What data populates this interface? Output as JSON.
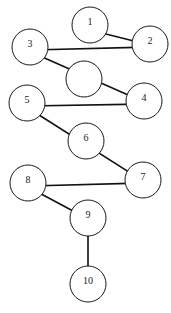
{
  "diagram": {
    "type": "directed-graph",
    "canvas": {
      "width": 171,
      "height": 313
    },
    "colors": {
      "background": "#ffffff",
      "node_stroke": "#1a1a1a",
      "node_fill": "#ffffff",
      "edge_stroke": "#111111",
      "label_color": "#1a1a1a"
    },
    "node_radius": 18,
    "nodes": [
      {
        "id": "n1",
        "label": "1",
        "cx": 90,
        "cy": 25,
        "r": 18,
        "labeled": true
      },
      {
        "id": "n2",
        "label": "2",
        "cx": 150,
        "cy": 44,
        "r": 18,
        "labeled": true
      },
      {
        "id": "n3",
        "label": "3",
        "cx": 30,
        "cy": 47,
        "r": 18,
        "labeled": true
      },
      {
        "id": "nU",
        "label": "",
        "cx": 84,
        "cy": 79,
        "r": 18,
        "labeled": false
      },
      {
        "id": "n4",
        "label": "4",
        "cx": 144,
        "cy": 101,
        "r": 18,
        "labeled": true
      },
      {
        "id": "n5",
        "label": "5",
        "cx": 27,
        "cy": 103,
        "r": 18,
        "labeled": true
      },
      {
        "id": "n6",
        "label": "6",
        "cx": 86,
        "cy": 141,
        "r": 18,
        "labeled": true
      },
      {
        "id": "n7",
        "label": "7",
        "cx": 143,
        "cy": 180,
        "r": 18,
        "labeled": true
      },
      {
        "id": "n8",
        "label": "8",
        "cx": 28,
        "cy": 183,
        "r": 18,
        "labeled": true
      },
      {
        "id": "n9",
        "label": "9",
        "cx": 88,
        "cy": 218,
        "r": 18,
        "labeled": true
      },
      {
        "id": "n10",
        "label": "10",
        "cx": 88,
        "cy": 284,
        "r": 18,
        "labeled": true
      }
    ],
    "edges": [
      {
        "id": "e1",
        "from": "n1",
        "to": "n2",
        "from_label": "1",
        "to_label": "2",
        "x1": 86,
        "y1": 29,
        "x2": 150,
        "y2": 45,
        "arrow": true
      },
      {
        "id": "e2",
        "from": "n3",
        "to": "n2",
        "from_label": "3",
        "to_label": "2",
        "x1": 32,
        "y1": 50,
        "x2": 150,
        "y2": 47,
        "arrow": true
      },
      {
        "id": "e3",
        "from": "n3",
        "to": "n4",
        "from_label": "3",
        "to_label": "4",
        "x1": 31,
        "y1": 52,
        "x2": 144,
        "y2": 102,
        "arrow": true
      },
      {
        "id": "e4",
        "from": "n5",
        "to": "n4",
        "from_label": "5",
        "to_label": "4",
        "x1": 28,
        "y1": 106,
        "x2": 144,
        "y2": 104,
        "arrow": true
      },
      {
        "id": "e5",
        "from": "n5",
        "to": "n7",
        "from_label": "5",
        "to_label": "7",
        "x1": 28,
        "y1": 108,
        "x2": 143,
        "y2": 181,
        "arrow": true
      },
      {
        "id": "e6",
        "from": "n8",
        "to": "n7",
        "from_label": "8",
        "to_label": "7",
        "x1": 30,
        "y1": 186,
        "x2": 143,
        "y2": 183,
        "arrow": true
      },
      {
        "id": "e7",
        "from": "n8",
        "to": "n9",
        "from_label": "8",
        "to_label": "9",
        "x1": 30,
        "y1": 188,
        "x2": 88,
        "y2": 219,
        "arrow": false
      },
      {
        "id": "e8",
        "from": "n9",
        "to": "n10",
        "from_label": "9",
        "to_label": "10",
        "x1": 88,
        "y1": 219,
        "x2": 88,
        "y2": 284,
        "arrow": true
      }
    ]
  }
}
